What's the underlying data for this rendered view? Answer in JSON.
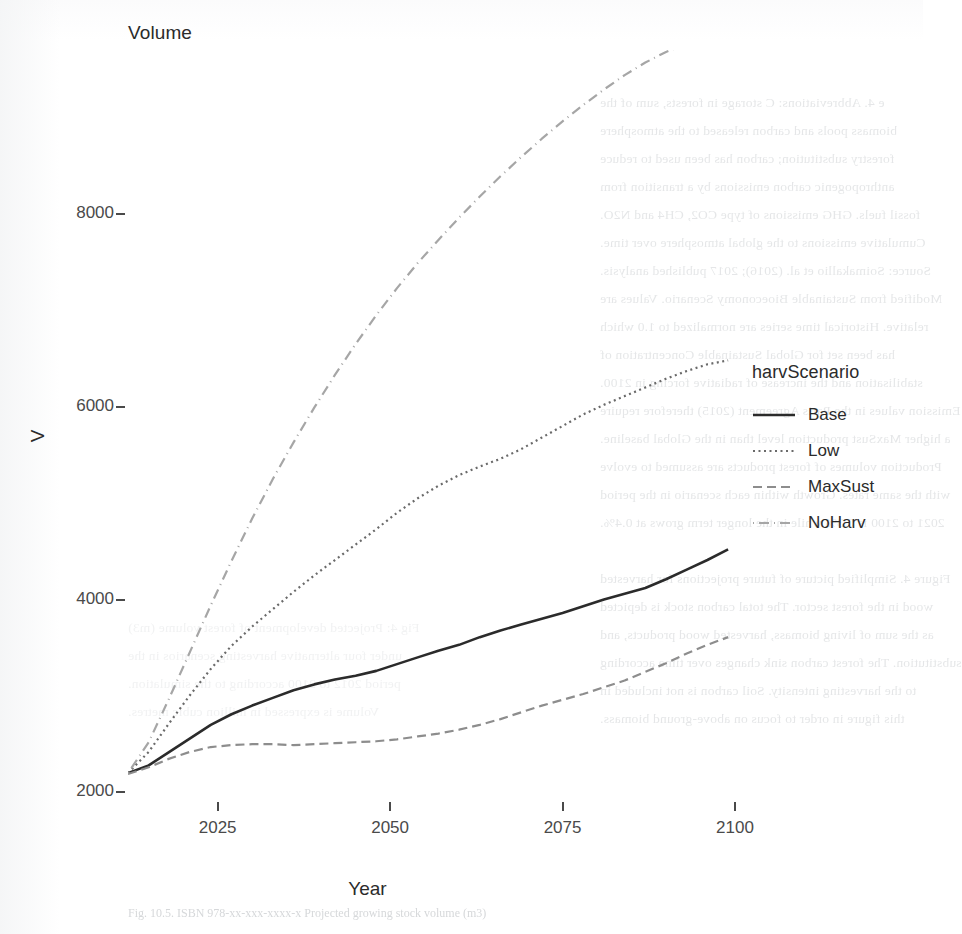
{
  "figure": {
    "plot_title": "Volume",
    "y_axis_title": "V",
    "x_axis_title": "Year"
  },
  "legend": {
    "title": "harvScenario",
    "items": [
      {
        "label": "Base",
        "style": "solid",
        "color": "#2b2b2b",
        "dash": "none"
      },
      {
        "label": "Low",
        "style": "dotted",
        "color": "#6a6a6a",
        "dash": "2,3"
      },
      {
        "label": "MaxSust",
        "style": "dashed",
        "color": "#8d8d8d",
        "dash": "9,5"
      },
      {
        "label": "NoHarv",
        "style": "dashdot",
        "color": "#a6a6a6",
        "dash": "1,6,9,6"
      }
    ]
  },
  "chart_data": {
    "type": "line",
    "title": "Volume",
    "xlabel": "Year",
    "ylabel": "V",
    "xlim": [
      2012,
      2100
    ],
    "ylim": [
      1900,
      9700
    ],
    "grid": false,
    "legend_position": "right",
    "legend_title": "harvScenario",
    "xticks": [
      2025,
      2050,
      2075,
      2100
    ],
    "yticks": [
      2000,
      4000,
      6000,
      8000
    ],
    "x": [
      2012,
      2015,
      2018,
      2021,
      2024,
      2027,
      2030,
      2033,
      2036,
      2039,
      2042,
      2045,
      2048,
      2051,
      2054,
      2057,
      2060,
      2063,
      2066,
      2069,
      2072,
      2075,
      2078,
      2081,
      2084,
      2087,
      2090,
      2093,
      2096,
      2099
    ],
    "series": [
      {
        "name": "Base",
        "style": "solid",
        "color": "#2b2b2b",
        "values": [
          2200,
          2280,
          2420,
          2560,
          2700,
          2810,
          2900,
          2980,
          3060,
          3120,
          3170,
          3210,
          3260,
          3330,
          3400,
          3470,
          3530,
          3610,
          3680,
          3740,
          3800,
          3860,
          3930,
          4000,
          4060,
          4120,
          4210,
          4310,
          4410,
          4520
        ]
      },
      {
        "name": "Low",
        "style": "dotted",
        "color": "#6a6a6a",
        "values": [
          2200,
          2420,
          2720,
          3010,
          3280,
          3520,
          3720,
          3900,
          4080,
          4250,
          4410,
          4570,
          4730,
          4900,
          5050,
          5180,
          5290,
          5380,
          5460,
          5560,
          5680,
          5800,
          5920,
          6020,
          6110,
          6200,
          6290,
          6370,
          6440,
          6480
        ]
      },
      {
        "name": "MaxSust",
        "style": "dashed",
        "color": "#8d8d8d",
        "values": [
          2190,
          2260,
          2350,
          2420,
          2470,
          2490,
          2500,
          2500,
          2490,
          2500,
          2510,
          2520,
          2530,
          2550,
          2580,
          2610,
          2650,
          2700,
          2760,
          2830,
          2900,
          2960,
          3020,
          3090,
          3160,
          3250,
          3340,
          3440,
          3530,
          3610
        ]
      },
      {
        "name": "NoHarv",
        "style": "dashdot",
        "color": "#a6a6a6",
        "values": [
          2200,
          2520,
          2980,
          3460,
          3940,
          4400,
          4840,
          5250,
          5630,
          5990,
          6330,
          6650,
          6950,
          7230,
          7490,
          7730,
          7960,
          8180,
          8390,
          8590,
          8780,
          8960,
          9130,
          9290,
          9440,
          9570,
          9680,
          9760,
          9810,
          9840
        ]
      }
    ]
  },
  "bleed_text": {
    "right_column": [
      "e 4. Abbreviations: C storage in forests, sum of the",
      "biomass pools and carbon released to the atmosphere",
      "forestry substitution; carbon has been used to reduce",
      "anthropogenic carbon emissions by a transition from",
      "fossil fuels. GHG emissions of type CO2, CH4 and N2O.",
      "Cumulative emissions to the global atmosphere over time.",
      "Source: Soimakallio et al. (2016); 2017 published analysis.",
      "Modified from Sustainable Bioeconomy Scenario. Values are",
      "relative. Historical time series are normalized to 1.0 which",
      "has been set for Global Sustainable Concentration of",
      "stabilisation and the increase of radiative forcing in 2100.",
      "Emission values in the Paris Agreement (2015) therefore require",
      "a higher MaxSust production level than in the Global baseline.",
      "Production volumes of forest products are assumed to evolve",
      "with the same rates. Growth within each scenario in the period",
      "2021 to 2100 is 0.3% while in the longer term grows at 0.4%.",
      "",
      "Figure 4. Simplified picture of future projections for harvested",
      "wood in the forest sector. The total carbon stock is depicted",
      "as the sum of living biomass, harvested wood products, and",
      "substitution. The forest carbon sink changes over time according",
      "to the harvesting intensity. Soil carbon is not included in",
      "this figure in order to focus on above-ground biomass."
    ],
    "left_column": [
      "Fig 4: Projected development of forest volume (m3)",
      "under four alternative harvesting scenarios in the",
      "period 2012 to 2100 according to the simulation.",
      "Volume is expressed in million cubic metres."
    ],
    "caption": "Fig. 10.5. ISBN 978-xx-xxx-xxxx-x  Projected growing stock volume (m3)"
  }
}
